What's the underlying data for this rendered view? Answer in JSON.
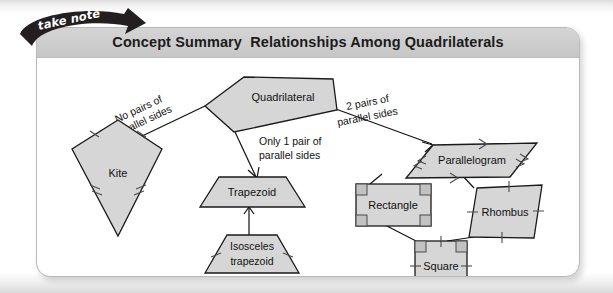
{
  "ribbon": {
    "text": "take note",
    "color": "#231f20"
  },
  "card": {
    "title": "Concept Summary  Relationships Among Quadrilaterals",
    "header_color": "#cdcdcd",
    "background": "#ffffff",
    "border_color": "#b9b9b9"
  },
  "diagram": {
    "type": "concept-hierarchy",
    "shape_fill": "#d6d6d6",
    "shape_stroke": "#1a1a1a",
    "nodes": [
      {
        "id": "quadrilateral",
        "label": "Quadrilateral",
        "shape": "irregular-quadrilateral"
      },
      {
        "id": "kite",
        "label": "Kite",
        "shape": "kite"
      },
      {
        "id": "trapezoid",
        "label": "Trapezoid",
        "shape": "trapezoid"
      },
      {
        "id": "isosceles-trapezoid",
        "label": "Isosceles",
        "label2": "trapezoid",
        "shape": "isosceles-trapezoid"
      },
      {
        "id": "parallelogram",
        "label": "Parallelogram",
        "shape": "parallelogram"
      },
      {
        "id": "rectangle",
        "label": "Rectangle",
        "shape": "rectangle"
      },
      {
        "id": "rhombus",
        "label": "Rhombus",
        "shape": "rhombus"
      },
      {
        "id": "square",
        "label": "Square",
        "shape": "square"
      }
    ],
    "edges": [
      {
        "from": "quadrilateral",
        "to": "kite",
        "label_line1": "No pairs of",
        "label_line2": "parallel sides"
      },
      {
        "from": "quadrilateral",
        "to": "trapezoid",
        "label_line1": "Only 1 pair of",
        "label_line2": "parallel sides"
      },
      {
        "from": "quadrilateral",
        "to": "parallelogram",
        "label_line1": "2 pairs of",
        "label_line2": "parallel sides"
      },
      {
        "from": "trapezoid",
        "to": "isosceles-trapezoid",
        "label_line1": "",
        "label_line2": ""
      },
      {
        "from": "parallelogram",
        "to": "rectangle",
        "label_line1": "",
        "label_line2": ""
      },
      {
        "from": "parallelogram",
        "to": "rhombus",
        "label_line1": "",
        "label_line2": ""
      },
      {
        "from": "rectangle",
        "to": "square",
        "label_line1": "",
        "label_line2": ""
      },
      {
        "from": "rhombus",
        "to": "square",
        "label_line1": "",
        "label_line2": ""
      }
    ]
  }
}
